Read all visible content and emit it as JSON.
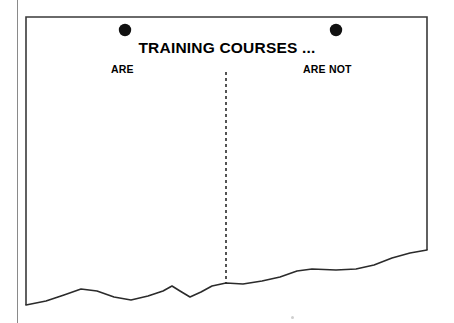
{
  "figure": {
    "title": "TRAINING COURSES ...",
    "left_label": "ARE",
    "right_label": "ARE NOT",
    "bullets": [
      {
        "name": "left-bullet",
        "cx": 125,
        "cy": 30,
        "r": 6.2
      },
      {
        "name": "right-bullet",
        "cx": 336,
        "cy": 30,
        "r": 6.2
      }
    ],
    "divider": {
      "kind": "dashed-vertical",
      "x": 226,
      "y_top": 72,
      "y_bottom": 283,
      "dash": "3 3"
    },
    "frame": {
      "left": 26,
      "top": 17,
      "right": 427,
      "stroke": "#3a3a3a",
      "stroke_width": 1.6
    },
    "colors": {
      "ink": "#000000",
      "line": "#2b2b2b",
      "frame": "#3a3a3a",
      "gutter": "#8a8a8a",
      "paper": "#ffffff"
    }
  },
  "chart_data": {
    "type": "line",
    "title": "TRAINING COURSES ...",
    "subtitle": "",
    "xlabel": "",
    "ylabel": "",
    "grid": false,
    "legend": null,
    "annotations": [
      {
        "text": "ARE",
        "x": 111,
        "y": 63,
        "side": "left"
      },
      {
        "text": "ARE NOT",
        "x": 303,
        "y": 63,
        "side": "right"
      },
      {
        "text": "TRAINING COURSES ...",
        "x": 227,
        "y": 40,
        "role": "title"
      }
    ],
    "divider_x": 226,
    "xlim": [
      26,
      427
    ],
    "ylim": [
      323,
      17
    ],
    "series": [
      {
        "name": "profile-line",
        "points": [
          [
            26,
            305
          ],
          [
            46,
            301
          ],
          [
            64,
            295
          ],
          [
            81,
            289
          ],
          [
            97,
            291
          ],
          [
            114,
            297
          ],
          [
            131,
            300
          ],
          [
            148,
            296
          ],
          [
            163,
            291
          ],
          [
            172,
            286
          ],
          [
            180,
            291
          ],
          [
            190,
            297
          ],
          [
            201,
            292
          ],
          [
            212,
            286
          ],
          [
            226,
            283
          ],
          [
            243,
            284
          ],
          [
            262,
            281
          ],
          [
            280,
            277
          ],
          [
            297,
            271
          ],
          [
            312,
            269
          ],
          [
            336,
            270
          ],
          [
            356,
            269
          ],
          [
            374,
            265
          ],
          [
            392,
            258
          ],
          [
            410,
            253
          ],
          [
            427,
            250
          ]
        ]
      }
    ]
  }
}
